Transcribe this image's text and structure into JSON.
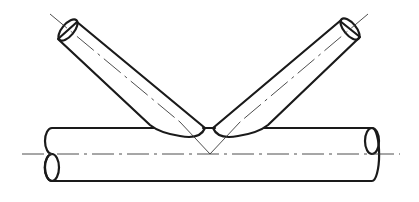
{
  "diagram": {
    "type": "technical-drawing",
    "components": [
      {
        "id": "chord",
        "label": "horizontal main pipe (chord)"
      },
      {
        "id": "brace-left",
        "label": "left inclined branch pipe"
      },
      {
        "id": "brace-right",
        "label": "right inclined branch pipe"
      },
      {
        "id": "centerlines",
        "label": "dash-dot centerlines meeting at chord axis"
      }
    ],
    "colors": {
      "stroke": "#1a1a1a",
      "centerline": "#3a3a3a",
      "background": "#ffffff"
    }
  }
}
